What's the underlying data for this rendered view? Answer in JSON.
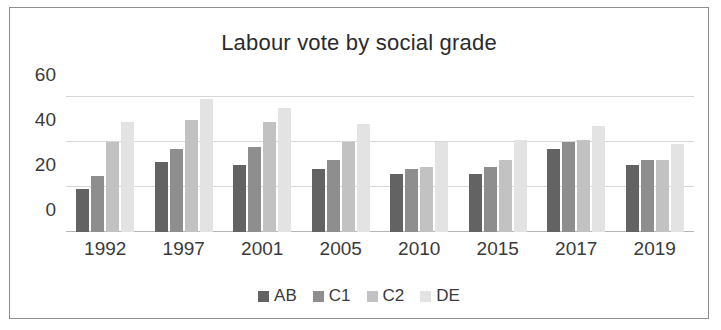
{
  "chart_data": {
    "type": "bar",
    "title": "Labour vote by social grade",
    "xlabel": "",
    "ylabel": "",
    "ylim": [
      0,
      65
    ],
    "yticks": [
      0,
      20,
      40,
      60
    ],
    "grid": true,
    "legend_position": "bottom",
    "categories": [
      "1992",
      "1997",
      "2001",
      "2005",
      "2010",
      "2015",
      "2017",
      "2019"
    ],
    "series": [
      {
        "name": "AB",
        "color": "#636363",
        "values": [
          19,
          31,
          30,
          28,
          26,
          26,
          37,
          30
        ]
      },
      {
        "name": "C1",
        "color": "#8e8e8e",
        "values": [
          25,
          37,
          38,
          32,
          28,
          29,
          40,
          32
        ]
      },
      {
        "name": "C2",
        "color": "#c2c2c2",
        "values": [
          40,
          50,
          49,
          40,
          29,
          32,
          41,
          32
        ]
      },
      {
        "name": "DE",
        "color": "#e3e3e3",
        "values": [
          49,
          59,
          55,
          48,
          40,
          41,
          47,
          39
        ]
      }
    ]
  },
  "legend": {
    "items": [
      {
        "label": "AB"
      },
      {
        "label": "C1"
      },
      {
        "label": "C2"
      },
      {
        "label": "DE"
      }
    ]
  },
  "colors": {
    "frame_border": "#8d8d8d",
    "gridline": "#d7d7d7",
    "text": "#3a3a3a",
    "background": "#ffffff"
  }
}
